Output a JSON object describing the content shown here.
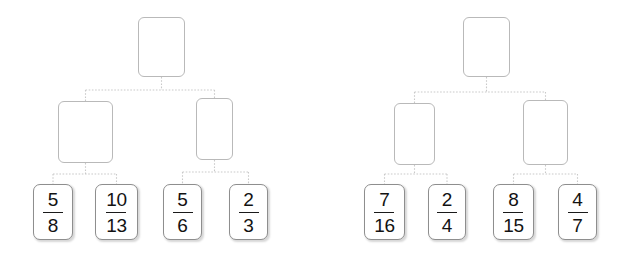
{
  "diagram": {
    "background_color": "#ffffff",
    "edge_color": "#c9c9c9",
    "edge_style": "dotted",
    "node_border_color": "#b9b9b9",
    "leaf_border_color": "#8e8e8e",
    "text_color": "#121212",
    "tree_count": 2
  },
  "trees": [
    {
      "id": "tree-left",
      "root": {
        "label": "",
        "x": 138,
        "y": 17,
        "w": 47,
        "h": 60
      },
      "internal": [
        {
          "id": "left-internal-1",
          "label": "",
          "x": 58,
          "y": 101,
          "w": 55,
          "h": 62
        },
        {
          "id": "left-internal-2",
          "label": "",
          "x": 196,
          "y": 98,
          "w": 37,
          "h": 62
        }
      ],
      "leaves": [
        {
          "id": "left-leaf-1",
          "numerator": "5",
          "denominator": "8",
          "x": 33,
          "y": 184,
          "w": 40,
          "h": 56
        },
        {
          "id": "left-leaf-2",
          "numerator": "10",
          "denominator": "13",
          "x": 95,
          "y": 184,
          "w": 43,
          "h": 56
        },
        {
          "id": "left-leaf-3",
          "numerator": "5",
          "denominator": "6",
          "x": 163,
          "y": 184,
          "w": 39,
          "h": 56
        },
        {
          "id": "left-leaf-4",
          "numerator": "2",
          "denominator": "3",
          "x": 229,
          "y": 184,
          "w": 39,
          "h": 56
        }
      ]
    },
    {
      "id": "tree-right",
      "root": {
        "label": "",
        "x": 463,
        "y": 17,
        "w": 47,
        "h": 60
      },
      "internal": [
        {
          "id": "right-internal-1",
          "label": "",
          "x": 394,
          "y": 103,
          "w": 41,
          "h": 62
        },
        {
          "id": "right-internal-2",
          "label": "",
          "x": 523,
          "y": 100,
          "w": 45,
          "h": 65
        }
      ],
      "leaves": [
        {
          "id": "right-leaf-1",
          "numerator": "7",
          "denominator": "16",
          "x": 364,
          "y": 184,
          "w": 41,
          "h": 56
        },
        {
          "id": "right-leaf-2",
          "numerator": "2",
          "denominator": "4",
          "x": 428,
          "y": 184,
          "w": 38,
          "h": 56
        },
        {
          "id": "right-leaf-3",
          "numerator": "8",
          "denominator": "15",
          "x": 493,
          "y": 184,
          "w": 41,
          "h": 56
        },
        {
          "id": "right-leaf-4",
          "numerator": "4",
          "denominator": "7",
          "x": 558,
          "y": 184,
          "w": 39,
          "h": 56
        }
      ]
    }
  ]
}
